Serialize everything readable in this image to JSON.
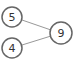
{
  "diagram": {
    "type": "number-bond",
    "parts": [
      {
        "id": "part-top",
        "value": "5",
        "cx": 12,
        "cy": 17
      },
      {
        "id": "part-bottom",
        "value": "4",
        "cx": 12,
        "cy": 48
      }
    ],
    "whole": {
      "id": "whole",
      "value": "9",
      "cx": 61,
      "cy": 33
    },
    "colors": {
      "circle_stroke": "#666666",
      "line": "#999999",
      "text": "#333333"
    }
  }
}
